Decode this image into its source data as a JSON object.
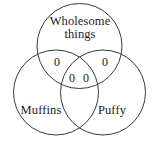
{
  "figure": {
    "type": "venn-diagram",
    "sets_count": 3,
    "stroke_color": "#3a3a3a",
    "text_color": "#1c1c1c",
    "background_color": "#ffffff"
  },
  "sets": {
    "top": {
      "label": "Wholesome\nthings"
    },
    "left": {
      "label": "Muffins"
    },
    "right": {
      "label": "Puffy"
    }
  },
  "regions": {
    "top_left_overlap": "0",
    "top_right_overlap": "0",
    "center_left": "0",
    "center_right": "0"
  }
}
